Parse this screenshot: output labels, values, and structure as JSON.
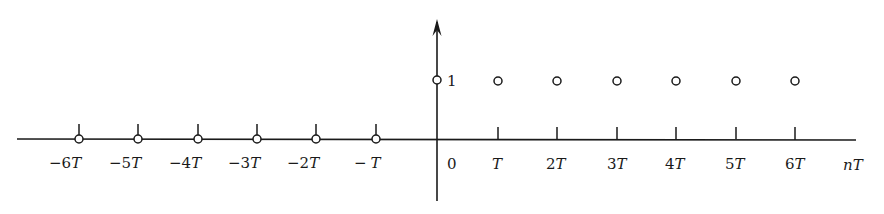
{
  "diagram": {
    "type": "discrete-time unit step sequence",
    "axis": {
      "horizontal_label": "nT",
      "origin_label": "0",
      "amplitude_label": "1"
    },
    "colors": {
      "ink": "#1a1a1a",
      "background": "#ffffff"
    },
    "samples": [
      {
        "n": -6,
        "label": "−6T",
        "value": 0
      },
      {
        "n": -5,
        "label": "−5T",
        "value": 0
      },
      {
        "n": -4,
        "label": "−4T",
        "value": 0
      },
      {
        "n": -3,
        "label": "−3T",
        "value": 0
      },
      {
        "n": -2,
        "label": "−2T",
        "value": 0
      },
      {
        "n": -1,
        "label": "−T",
        "value": 0
      },
      {
        "n": 0,
        "label": "0",
        "value": 1
      },
      {
        "n": 1,
        "label": "T",
        "value": 1
      },
      {
        "n": 2,
        "label": "2T",
        "value": 1
      },
      {
        "n": 3,
        "label": "3T",
        "value": 1
      },
      {
        "n": 4,
        "label": "4T",
        "value": 1
      },
      {
        "n": 5,
        "label": "5T",
        "value": 1
      },
      {
        "n": 6,
        "label": "6T",
        "value": 1
      }
    ],
    "tick_labels": {
      "neg6": "−6",
      "neg5": "−5",
      "neg4": "−4",
      "neg3": "−3",
      "neg2": "−2",
      "neg1": "−",
      "pos1": "",
      "pos2": "2",
      "pos3": "3",
      "pos4": "4",
      "pos5": "5",
      "pos6": "6",
      "T": "T",
      "n": "n"
    }
  }
}
